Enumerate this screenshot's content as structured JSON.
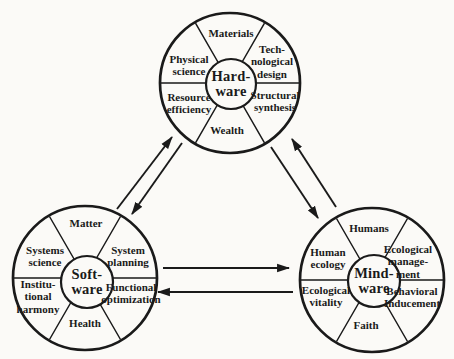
{
  "colors": {
    "background": "#fbfaf7",
    "ink": "#1a1a1a"
  },
  "wheels": [
    {
      "name": "hardware",
      "hub": "Hard-\nware",
      "segments": {
        "top": "Materials",
        "upper_right": "Tech-\nnological\ndesign",
        "lower_right": "Structural\nsynthesis",
        "bottom": "Wealth",
        "lower_left": "Resource\nefficiency",
        "upper_left": "Physical\nscience"
      }
    },
    {
      "name": "software",
      "hub": "Soft-\nware",
      "segments": {
        "top": "Matter",
        "upper_right": "System\nplanning",
        "lower_right": "Functional\noptimization",
        "bottom": "Health",
        "lower_left": "Institu-\ntional\nharmony",
        "upper_left": "Systems\nscience"
      }
    },
    {
      "name": "mindware",
      "hub": "Mind-\nware",
      "segments": {
        "top": "Humans",
        "upper_right": "Ecological\nmanage-\nment",
        "lower_right": "Behavioral\nInducement",
        "bottom": "Faith",
        "lower_left": "Ecological\nvitality",
        "upper_left": "Human\necology"
      }
    }
  ],
  "connections": [
    {
      "between": [
        "Software",
        "Hardware"
      ],
      "style": "paired-opposite-arrows"
    },
    {
      "between": [
        "Hardware",
        "Mindware"
      ],
      "style": "paired-opposite-arrows"
    },
    {
      "between": [
        "Software",
        "Mindware"
      ],
      "style": "paired-opposite-arrows"
    }
  ]
}
